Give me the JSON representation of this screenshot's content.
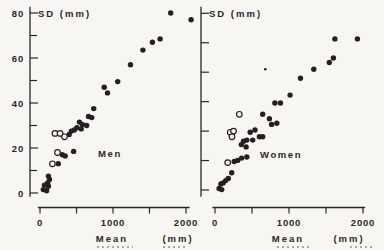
{
  "figure": {
    "background": "#f7f6f3",
    "ink": "#2b2628",
    "point_color": "#241f22"
  },
  "chart_data": [
    {
      "type": "scatter",
      "panel": "left",
      "ylabel": "SD (mm)",
      "xlabel_word": "Mean",
      "xlabel_unit": "(mm)",
      "annotation": "Men",
      "xlim": [
        0,
        2000
      ],
      "ylim": [
        0,
        80
      ],
      "grid": false,
      "x_ticks": [
        {
          "v": 0,
          "label": "0"
        },
        {
          "v": 500,
          "label": ""
        },
        {
          "v": 1000,
          "label": "1000"
        },
        {
          "v": 1500,
          "label": ""
        },
        {
          "v": 2000,
          "label": "2000"
        }
      ],
      "y_ticks": [
        {
          "v": 0,
          "label": "0"
        },
        {
          "v": 10,
          "label": ""
        },
        {
          "v": 20,
          "label": "20"
        },
        {
          "v": 30,
          "label": ""
        },
        {
          "v": 40,
          "label": "40"
        },
        {
          "v": 50,
          "label": ""
        },
        {
          "v": 60,
          "label": "60"
        },
        {
          "v": 70,
          "label": ""
        },
        {
          "v": 80,
          "label": "80"
        }
      ],
      "series": [
        {
          "name": "men-filled",
          "marker": "filled-circle",
          "r": 2.7,
          "points": [
            [
              45,
              1.5
            ],
            [
              60,
              3.5
            ],
            [
              90,
              1
            ],
            [
              105,
              4.5
            ],
            [
              115,
              3
            ],
            [
              115,
              7.5
            ],
            [
              130,
              6
            ],
            [
              250,
              13
            ],
            [
              305,
              17
            ],
            [
              345,
              16.5
            ],
            [
              460,
              18.5
            ],
            [
              400,
              26
            ],
            [
              430,
              27.5
            ],
            [
              470,
              28
            ],
            [
              505,
              29
            ],
            [
              540,
              31.5
            ],
            [
              565,
              28.5
            ],
            [
              580,
              30.5
            ],
            [
              640,
              30
            ],
            [
              665,
              34
            ],
            [
              710,
              33.5
            ],
            [
              735,
              37.5
            ],
            [
              880,
              47
            ],
            [
              925,
              44.5
            ],
            [
              1065,
              49.5
            ],
            [
              1240,
              57
            ],
            [
              1410,
              63.5
            ],
            [
              1540,
              67
            ],
            [
              1645,
              68.5
            ],
            [
              1790,
              80
            ],
            [
              2070,
              77
            ]
          ]
        },
        {
          "name": "men-open",
          "marker": "open-circle",
          "r": 2.8,
          "points": [
            [
              170,
              13
            ],
            [
              240,
              18
            ],
            [
              205,
              26.5
            ],
            [
              275,
              26.5
            ],
            [
              335,
              25
            ]
          ]
        }
      ]
    },
    {
      "type": "scatter",
      "panel": "right",
      "ylabel": "SD (mm)",
      "xlabel_word": "Mean",
      "xlabel_unit": "(mm)",
      "annotation": "Women",
      "xlim": [
        0,
        2000
      ],
      "ylim": [
        0,
        80
      ],
      "grid": false,
      "x_ticks": [
        {
          "v": 0,
          "label": "0"
        },
        {
          "v": 500,
          "label": ""
        },
        {
          "v": 1000,
          "label": "1000"
        },
        {
          "v": 1500,
          "label": ""
        },
        {
          "v": 2000,
          "label": "2000"
        }
      ],
      "y_ticks": [],
      "unlabeled_y_tick_count": 7,
      "series": [
        {
          "name": "women-filled",
          "marker": "filled-circle",
          "r": 2.7,
          "points": [
            [
              55,
              2
            ],
            [
              80,
              4
            ],
            [
              90,
              1.5
            ],
            [
              110,
              4.5
            ],
            [
              145,
              5.5
            ],
            [
              180,
              6.5
            ],
            [
              225,
              9
            ],
            [
              260,
              14
            ],
            [
              305,
              14.5
            ],
            [
              360,
              15.5
            ],
            [
              430,
              16
            ],
            [
              355,
              21.5
            ],
            [
              420,
              20.5
            ],
            [
              385,
              23
            ],
            [
              430,
              23.5
            ],
            [
              510,
              23.5
            ],
            [
              475,
              27
            ],
            [
              540,
              28
            ],
            [
              600,
              25
            ],
            [
              645,
              25
            ],
            [
              645,
              35
            ],
            [
              735,
              33
            ],
            [
              765,
              30.5
            ],
            [
              835,
              31
            ],
            [
              810,
              40
            ],
            [
              885,
              40
            ],
            [
              1015,
              43.5
            ],
            [
              1155,
              51
            ],
            [
              1335,
              55
            ],
            [
              1545,
              58
            ],
            [
              1600,
              60
            ],
            [
              1620,
              68.5
            ],
            [
              1925,
              68.5
            ]
          ]
        },
        {
          "name": "women-open",
          "marker": "open-circle",
          "r": 2.8,
          "points": [
            [
              172,
              13.5
            ],
            [
              205,
              27
            ],
            [
              230,
              25
            ],
            [
              250,
              27.5
            ],
            [
              328,
              35
            ]
          ]
        },
        {
          "name": "women-small-filled",
          "marker": "filled-circle",
          "r": 1.3,
          "points": [
            [
              680,
              55
            ]
          ]
        }
      ]
    }
  ]
}
